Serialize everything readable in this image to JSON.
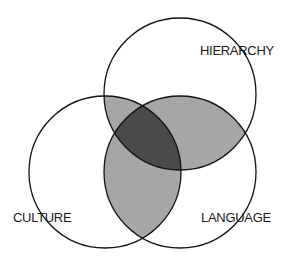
{
  "diagram": {
    "type": "venn",
    "sets": [
      {
        "id": "hierarchy",
        "label": "HIERARCHY"
      },
      {
        "id": "culture",
        "label": "CULTURE"
      },
      {
        "id": "language",
        "label": "LANGUAGE"
      }
    ],
    "colors": {
      "background": "#ffffff",
      "outline": "#111111",
      "pairwise_overlap": "#a6a6a6",
      "triple_overlap": "#4a4a4a"
    }
  }
}
